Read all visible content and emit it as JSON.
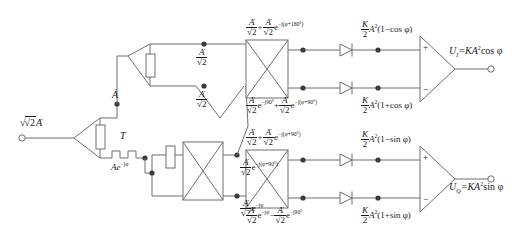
{
  "figure": {
    "line_color": "#6f6f6f",
    "text_color": "#1a1a1a",
    "background": "#ffffff"
  },
  "input": {
    "terminal_label_prefix": "√2",
    "terminal_label_var": "A",
    "delay_label": "T",
    "node_a_label": "A",
    "delayed_label_base": "Ae",
    "delayed_label_exp": "−jφ"
  },
  "splitter": {
    "out_top_num": "A",
    "out_top_den": "√2",
    "out_bottom_num": "A",
    "out_bottom_den": "√2"
  },
  "hybrid_lower_left": {
    "out_top_frac_num": "A",
    "out_top_frac_den": "√2",
    "out_top_exp_base": "e",
    "out_top_exp": "−j(φ+90°)",
    "out_bottom_frac_num": "A",
    "out_bottom_frac_den": "√2",
    "out_bottom_exp_base": "e",
    "out_bottom_exp": "−jφ"
  },
  "hybrid_top": {
    "sum_top": {
      "t1_num": "A",
      "t1_den": "√2",
      "op": "+",
      "t2_num": "A",
      "t2_den": "√2",
      "t2_exp_base": "e",
      "t2_exp": "−j(φ+180°)"
    },
    "sum_bottom": {
      "t1_num": "A",
      "t1_den": "√2",
      "t1_exp_base": "e",
      "t1_exp": "−j90°",
      "op": "+",
      "t2_num": "A",
      "t2_den": "√2",
      "t2_exp_base": "e",
      "t2_exp": "−j(φ+90°)"
    }
  },
  "hybrid_bottom": {
    "sum_top": {
      "t1_num": "A",
      "t1_den": "√2",
      "op": "+",
      "t2_num": "A",
      "t2_den": "√2",
      "t2_exp_base": "e",
      "t2_exp": "−j(φ+90°)"
    },
    "sum_bottom": {
      "t1_num": "A",
      "t1_den": "√2",
      "t1_exp_base": "e",
      "t1_exp": "−jφ",
      "op": "−",
      "t2_num": "A",
      "t2_den": "√2",
      "t2_exp_base": "e",
      "t2_exp": "−j90°"
    }
  },
  "detected": {
    "row1": {
      "k_num": "K",
      "k_den": "2",
      "body": "A",
      "pow": "2",
      "paren": "(1−cos φ)"
    },
    "row2": {
      "k_num": "K",
      "k_den": "2",
      "body": "A",
      "pow": "2",
      "paren": "(1+cos φ)"
    },
    "row3": {
      "k_num": "K",
      "k_den": "2",
      "body": "A",
      "pow": "2",
      "paren": "(1−sin φ)"
    },
    "row4": {
      "k_num": "K",
      "k_den": "2",
      "body": "A",
      "pow": "2",
      "paren": "(1+sin φ)"
    }
  },
  "amplifiers": {
    "top": {
      "plus": "+",
      "minus": "−"
    },
    "bottom": {
      "plus": "+",
      "minus": "−"
    }
  },
  "outputs": {
    "top": {
      "name": "U",
      "sub": "I",
      "eq": "=KA",
      "pow": "2",
      "tail": "cos φ"
    },
    "bottom": {
      "name": "U",
      "sub": "Q",
      "eq": "=KA",
      "pow": "2",
      "tail": "sin φ"
    }
  }
}
